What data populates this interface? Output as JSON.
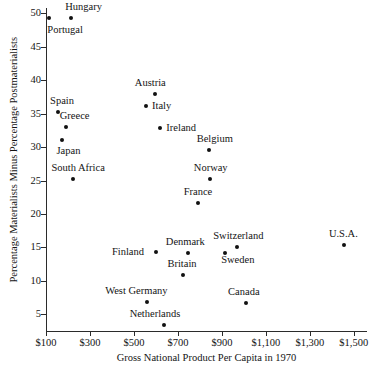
{
  "chart_data": {
    "type": "scatter",
    "title": "",
    "xlabel": "Gross National Product Per Capita in 1970",
    "ylabel": "Percentage Materialists Minus Percentage Postmaterialists",
    "xlim": [
      100,
      1560
    ],
    "ylim": [
      2.5,
      50.8
    ],
    "grid": false,
    "legend": null,
    "xticks": [
      {
        "value": 100,
        "label": "$100"
      },
      {
        "value": 300,
        "label": "$300"
      },
      {
        "value": 500,
        "label": "$500"
      },
      {
        "value": 700,
        "label": "$700"
      },
      {
        "value": 900,
        "label": "$900"
      },
      {
        "value": 1100,
        "label": "$1,100"
      },
      {
        "value": 1300,
        "label": "$1,300"
      },
      {
        "value": 1500,
        "label": "$1,500"
      }
    ],
    "yticks": [
      {
        "value": 5,
        "label": "5"
      },
      {
        "value": 10,
        "label": "10"
      },
      {
        "value": 15,
        "label": "15"
      },
      {
        "value": 20,
        "label": "20"
      },
      {
        "value": 25,
        "label": "25"
      },
      {
        "value": 30,
        "label": "30"
      },
      {
        "value": 35,
        "label": "35"
      },
      {
        "value": 40,
        "label": "40"
      },
      {
        "value": 45,
        "label": "45"
      },
      {
        "value": 50,
        "label": "50"
      }
    ],
    "points": [
      {
        "label": "Portugal",
        "x": 115,
        "y": 49.3,
        "label_dx": -2,
        "label_dy": 12
      },
      {
        "label": "Hungary",
        "x": 215,
        "y": 49.3,
        "label_dx": -6,
        "label_dy": -11
      },
      {
        "label": "Austria",
        "x": 595,
        "y": 38.0,
        "label_dx": -20,
        "label_dy": -11
      },
      {
        "label": "Italy",
        "x": 555,
        "y": 36.1,
        "label_dx": 6,
        "label_dy": 0
      },
      {
        "label": "Spain",
        "x": 155,
        "y": 35.2,
        "label_dx": -8,
        "label_dy": -11
      },
      {
        "label": "Greece",
        "x": 190,
        "y": 33.0,
        "label_dx": -6,
        "label_dy": -11
      },
      {
        "label": "Ireland",
        "x": 620,
        "y": 32.9,
        "label_dx": 6,
        "label_dy": 0
      },
      {
        "label": "Japan",
        "x": 175,
        "y": 31.0,
        "label_dx": -6,
        "label_dy": 11
      },
      {
        "label": "Belgium",
        "x": 840,
        "y": 29.5,
        "label_dx": -12,
        "label_dy": -11
      },
      {
        "label": "South Africa",
        "x": 225,
        "y": 25.2,
        "label_dx": -22,
        "label_dy": -11
      },
      {
        "label": "Norway",
        "x": 845,
        "y": 25.2,
        "label_dx": -16,
        "label_dy": -11
      },
      {
        "label": "France",
        "x": 790,
        "y": 21.7,
        "label_dx": -14,
        "label_dy": -11
      },
      {
        "label": "Switzerland",
        "x": 970,
        "y": 15.1,
        "label_dx": -24,
        "label_dy": -11
      },
      {
        "label": "U.S.A.",
        "x": 1455,
        "y": 15.4,
        "label_dx": -15,
        "label_dy": -11
      },
      {
        "label": "Finland",
        "x": 600,
        "y": 14.3,
        "label_dx": -44,
        "label_dy": 0
      },
      {
        "label": "Denmark",
        "x": 745,
        "y": 14.2,
        "label_dx": -22,
        "label_dy": -11
      },
      {
        "label": "Sweden",
        "x": 915,
        "y": 14.2,
        "label_dx": -4,
        "label_dy": 7
      },
      {
        "label": "Britain",
        "x": 725,
        "y": 10.9,
        "label_dx": -16,
        "label_dy": -11
      },
      {
        "label": "Canada",
        "x": 1010,
        "y": 6.7,
        "label_dx": -18,
        "label_dy": -11
      },
      {
        "label": "West Germany",
        "x": 560,
        "y": 6.8,
        "label_dx": -42,
        "label_dy": -11
      },
      {
        "label": "Netherlands",
        "x": 635,
        "y": 3.4,
        "label_dx": -34,
        "label_dy": -11
      }
    ]
  }
}
